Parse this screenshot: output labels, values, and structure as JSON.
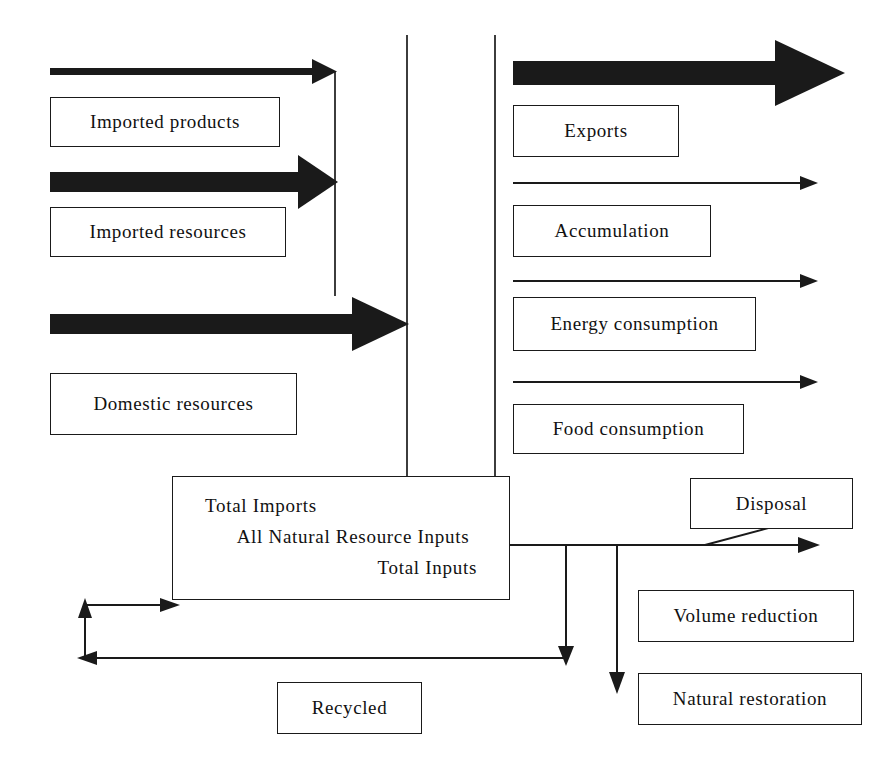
{
  "diagram": {
    "accent_color": "#1a1a1a",
    "background_color": "#ffffff"
  },
  "inputs": {
    "boxes": [
      {
        "id": "imported-products",
        "label": "Imported products"
      },
      {
        "id": "imported-resources",
        "label": "Imported resources"
      },
      {
        "id": "domestic-resources",
        "label": "Domestic resources"
      }
    ],
    "arrows": [
      {
        "id": "imported-products-arrow",
        "style": "thin-bold",
        "direction": "right"
      },
      {
        "id": "imported-resources-arrow",
        "style": "thick-bold",
        "direction": "right"
      },
      {
        "id": "domestic-resources-arrow",
        "style": "thick-bold",
        "direction": "right"
      }
    ]
  },
  "outputs": {
    "boxes": [
      {
        "id": "exports",
        "label": "Exports"
      },
      {
        "id": "accumulation",
        "label": "Accumulation"
      },
      {
        "id": "energy-consumption",
        "label": "Energy consumption"
      },
      {
        "id": "food-consumption",
        "label": "Food consumption"
      }
    ],
    "arrows": [
      {
        "id": "exports-arrow",
        "style": "extra-thick-bold",
        "direction": "right"
      },
      {
        "id": "accumulation-arrow",
        "style": "thin",
        "direction": "right"
      },
      {
        "id": "energy-consumption-arrow",
        "style": "thin",
        "direction": "right"
      },
      {
        "id": "food-consumption-arrow",
        "style": "thin",
        "direction": "right"
      }
    ]
  },
  "center": {
    "id": "total-inputs-box",
    "lines": [
      "Total Imports",
      "All Natural Resource Inputs",
      "Total Inputs"
    ]
  },
  "disposal_chain": {
    "boxes": [
      {
        "id": "disposal",
        "label": "Disposal"
      },
      {
        "id": "volume-reduction",
        "label": "Volume reduction"
      },
      {
        "id": "natural-restoration",
        "label": "Natural restoration"
      }
    ]
  },
  "recycling": {
    "box": {
      "id": "recycled",
      "label": "Recycled"
    },
    "loop_direction": "counter-clockwise"
  },
  "connectors": [
    {
      "id": "input-column-line-left",
      "type": "vertical-line"
    },
    {
      "id": "input-column-line-right",
      "type": "vertical-line"
    },
    {
      "id": "imported-collector-line",
      "type": "vertical-line"
    },
    {
      "id": "disposal-branch-line",
      "type": "branch"
    },
    {
      "id": "volume-reduction-arrow",
      "type": "arrow-right"
    },
    {
      "id": "natural-restoration-arrow",
      "type": "arrow-down"
    },
    {
      "id": "recycle-return-arrow",
      "type": "arrow-loop"
    }
  ]
}
